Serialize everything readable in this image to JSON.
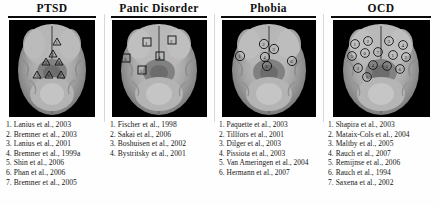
{
  "figure": {
    "background_color": "#ffffff",
    "panel_count": 4
  },
  "panels": [
    {
      "id": "ptsd",
      "title": "PTSD",
      "marker_shape": "triangle",
      "image": {
        "name": "axial-brain-mri-ptsd",
        "background_color": "#000000",
        "modality": "axial MRI slice"
      },
      "markers": [
        {
          "label": "1",
          "x": 48,
          "y": 22
        },
        {
          "label": "2",
          "x": 44,
          "y": 34
        },
        {
          "label": "3",
          "x": 37,
          "y": 42
        },
        {
          "label": "4",
          "x": 50,
          "y": 42
        },
        {
          "label": "5",
          "x": 28,
          "y": 55
        },
        {
          "label": "6",
          "x": 40,
          "y": 55
        },
        {
          "label": "7",
          "x": 52,
          "y": 55
        }
      ],
      "references": [
        "1. Lanius et al., 2003",
        "2. Bremner et al., 2003",
        "3. Lanius et al., 2001",
        "4. Bremner et al., 1999a",
        "5. Shin et al., 2006",
        "6. Phan et al., 2006",
        "7. Bremner et al., 2005"
      ]
    },
    {
      "id": "panic",
      "title": "Panic Disorder",
      "marker_shape": "square",
      "image": {
        "name": "axial-brain-mri-panic-disorder",
        "background_color": "#000000",
        "modality": "axial MRI slice"
      },
      "markers": [
        {
          "label": "1",
          "x": 35,
          "y": 22
        },
        {
          "label": "2",
          "x": 60,
          "y": 20
        },
        {
          "label": "3",
          "x": 14,
          "y": 38
        },
        {
          "label": "4",
          "x": 48,
          "y": 36
        },
        {
          "label": "5",
          "x": 30,
          "y": 50
        }
      ],
      "references": [
        "1. Fischer et al., 1998",
        "2. Sakai et al., 2006",
        "3. Boshuisen et al., 2002",
        "4. Bystritsky et al., 2001"
      ]
    },
    {
      "id": "phobia",
      "title": "Phobia",
      "marker_shape": "circle",
      "image": {
        "name": "axial-brain-mri-phobia",
        "background_color": "#000000",
        "modality": "axial MRI slice"
      },
      "markers": [
        {
          "label": "1",
          "x": 22,
          "y": 36
        },
        {
          "label": "2",
          "x": 44,
          "y": 25
        },
        {
          "label": "3",
          "x": 52,
          "y": 30
        },
        {
          "label": "4",
          "x": 45,
          "y": 38
        },
        {
          "label": "5",
          "x": 47,
          "y": 46
        },
        {
          "label": "6",
          "x": 70,
          "y": 41
        }
      ],
      "references": [
        "1. Paquette et al., 2003",
        "2. Tillfors et al., 2001",
        "3. Dilger et al., 2003",
        "4. Pissiota et al., 2003",
        "5. Van Ameringen et al., 2004",
        "6. Hermann et al., 2007"
      ]
    },
    {
      "id": "ocd",
      "title": "OCD",
      "marker_shape": "circle",
      "image": {
        "name": "axial-brain-mri-ocd",
        "background_color": "#000000",
        "modality": "axial MRI slice"
      },
      "markers": [
        {
          "label": "1",
          "x": 26,
          "y": 24
        },
        {
          "label": "2",
          "x": 40,
          "y": 22
        },
        {
          "label": "3",
          "x": 57,
          "y": 22
        },
        {
          "label": "4",
          "x": 70,
          "y": 26
        },
        {
          "label": "5",
          "x": 22,
          "y": 36
        },
        {
          "label": "6",
          "x": 36,
          "y": 34
        },
        {
          "label": "7",
          "x": 48,
          "y": 33
        },
        {
          "label": "1",
          "x": 62,
          "y": 36
        },
        {
          "label": "2",
          "x": 74,
          "y": 38
        },
        {
          "label": "3",
          "x": 28,
          "y": 48
        },
        {
          "label": "4",
          "x": 42,
          "y": 46
        },
        {
          "label": "5",
          "x": 55,
          "y": 47
        },
        {
          "label": "6",
          "x": 68,
          "y": 50
        },
        {
          "label": "7",
          "x": 36,
          "y": 58
        }
      ],
      "references": [
        "1. Shapira et al., 2003",
        "2. Mataix-Cols et al., 2004",
        "3. Maltby et al., 2005",
        "4. Rauch et al., 2007",
        "5. Remijnse et al., 2006",
        "6. Rauch et al., 1994",
        "7. Saxena et al., 2002"
      ]
    }
  ]
}
